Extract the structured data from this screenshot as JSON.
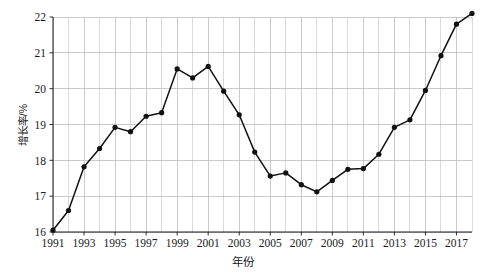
{
  "chart_data": {
    "type": "line",
    "title": "",
    "xlabel": "年份",
    "ylabel": "增长率/%",
    "xlim": [
      1991,
      2018
    ],
    "ylim": [
      16,
      22
    ],
    "grid": true,
    "legend": "none",
    "x_tick_labels": [
      "1991",
      "1993",
      "1995",
      "1997",
      "1999",
      "2001",
      "2003",
      "2005",
      "2007",
      "2009",
      "2011",
      "2013",
      "2015",
      "2017"
    ],
    "x_tick_values": [
      1991,
      1993,
      1995,
      1997,
      1999,
      2001,
      2003,
      2005,
      2007,
      2009,
      2011,
      2013,
      2015,
      2017
    ],
    "y_tick_labels": [
      "16",
      "17",
      "18",
      "19",
      "20",
      "21",
      "22"
    ],
    "y_tick_values": [
      16,
      17,
      18,
      19,
      20,
      21,
      22
    ],
    "x": [
      1991,
      1992,
      1993,
      1994,
      1995,
      1996,
      1997,
      1998,
      1999,
      2000,
      2001,
      2002,
      2003,
      2004,
      2005,
      2006,
      2007,
      2008,
      2009,
      2010,
      2011,
      2012,
      2013,
      2014,
      2015,
      2016,
      2017,
      2018
    ],
    "categories": [
      1991,
      1992,
      1993,
      1994,
      1995,
      1996,
      1997,
      1998,
      1999,
      2000,
      2001,
      2002,
      2003,
      2004,
      2005,
      2006,
      2007,
      2008,
      2009,
      2010,
      2011,
      2012,
      2013,
      2014,
      2015,
      2016,
      2017,
      2018
    ],
    "values": [
      16.05,
      16.6,
      17.82,
      18.33,
      18.92,
      18.8,
      19.23,
      19.33,
      20.55,
      20.3,
      20.62,
      19.93,
      19.27,
      18.23,
      17.56,
      17.65,
      17.32,
      17.12,
      17.44,
      17.75,
      17.77,
      18.17,
      18.92,
      19.13,
      19.95,
      20.92,
      21.8,
      22.1
    ],
    "series": [
      {
        "name": "增长率",
        "marker": "circle",
        "color": "#111111",
        "values": [
          16.05,
          16.6,
          17.82,
          18.33,
          18.92,
          18.8,
          19.23,
          19.33,
          20.55,
          20.3,
          20.62,
          19.93,
          19.27,
          18.23,
          17.56,
          17.65,
          17.32,
          17.12,
          17.44,
          17.75,
          17.77,
          18.17,
          18.92,
          19.13,
          19.95,
          20.92,
          21.8,
          22.1
        ]
      }
    ]
  },
  "colors": {
    "line": "#111111",
    "marker": "#111111",
    "grid": "#c9c9cf",
    "axis": "#1a1a1a",
    "background": "#ffffff"
  }
}
